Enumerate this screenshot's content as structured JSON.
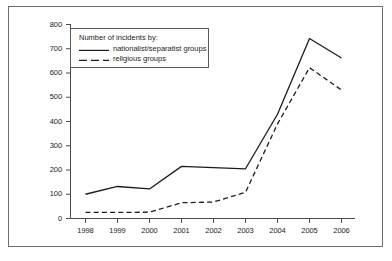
{
  "chart_data": {
    "type": "line",
    "title": "",
    "xlabel": "",
    "ylabel": "",
    "categories": [
      "1998",
      "1999",
      "2000",
      "2001",
      "2002",
      "2003",
      "2004",
      "2005",
      "2006"
    ],
    "series": [
      {
        "name": "nationalist/separatist groups",
        "style": "solid",
        "color": "#1c1c1c",
        "values": [
          100,
          132,
          122,
          215,
          210,
          205,
          430,
          742,
          662
        ]
      },
      {
        "name": "religious groups",
        "style": "dashed",
        "color": "#1c1c1c",
        "values": [
          25,
          25,
          26,
          65,
          68,
          108,
          390,
          622,
          530
        ]
      }
    ],
    "ylim": [
      0,
      800
    ],
    "yticks": [
      "0",
      "100",
      "200",
      "300",
      "400",
      "500",
      "600",
      "700",
      "800"
    ],
    "xticks": [
      "1998",
      "1999",
      "2000",
      "2001",
      "2002",
      "2003",
      "2004",
      "2005",
      "2006"
    ],
    "grid": false,
    "legend_position": "upper-left-inside"
  },
  "legend": {
    "title": "Number of incidents by:",
    "entries": [
      {
        "label": "nationalist/separatist groups",
        "style": "solid"
      },
      {
        "label": "religious groups",
        "style": "dashed"
      }
    ]
  }
}
